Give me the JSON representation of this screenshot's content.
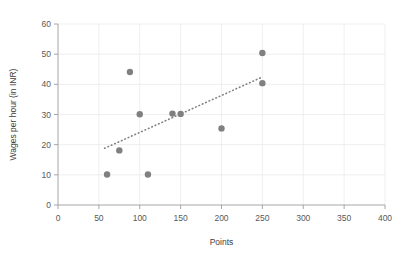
{
  "chart_data": {
    "type": "scatter",
    "title": "",
    "xlabel": "Points",
    "ylabel": "Wages per hour (in INR)",
    "xlim": [
      0,
      400
    ],
    "ylim": [
      0,
      60
    ],
    "xticks": [
      0,
      50,
      100,
      150,
      200,
      250,
      300,
      350,
      400
    ],
    "yticks": [
      0,
      10,
      20,
      30,
      40,
      50,
      60
    ],
    "xtick_labels": [
      "0",
      "50",
      "100",
      "150",
      "200",
      "250",
      "300",
      "350",
      "400"
    ],
    "ytick_labels": [
      "0",
      "10",
      "20",
      "30",
      "40",
      "50",
      "60"
    ],
    "grid": true,
    "grid_axis": "both",
    "legend": false,
    "marker_color": "#808080",
    "trendline_color": "#808080",
    "trendline_style": "dotted",
    "points": [
      {
        "x": 60,
        "y": 10.1
      },
      {
        "x": 75,
        "y": 18.1
      },
      {
        "x": 88,
        "y": 44.1
      },
      {
        "x": 100,
        "y": 30.1
      },
      {
        "x": 110,
        "y": 10.1
      },
      {
        "x": 140,
        "y": 30.3
      },
      {
        "x": 150,
        "y": 30.2
      },
      {
        "x": 200,
        "y": 25.4
      },
      {
        "x": 250,
        "y": 50.4
      },
      {
        "x": 250,
        "y": 40.4
      }
    ],
    "trendline": {
      "x0": 57,
      "y0": 18.8,
      "x1": 248,
      "y1": 42.2
    }
  },
  "axes": {
    "x_axis_name": "points-axis",
    "y_axis_name": "wages-axis"
  }
}
